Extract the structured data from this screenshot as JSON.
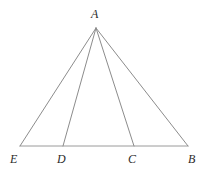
{
  "figure": {
    "kind": "euclidean-geometry-diagram",
    "canvas": {
      "width": 203,
      "height": 176,
      "background": "#ffffff"
    },
    "style": {
      "stroke_color": "#8c8c8c",
      "baseline_stroke_color": "#9a9a9a",
      "stroke_width": 1,
      "label_color": "#2b2b2b",
      "label_font_size_px": 12
    },
    "points": [
      {
        "id": "A",
        "label": "A",
        "x": 96,
        "y": 28,
        "label_x": 91,
        "label_y": 8,
        "role": "apex"
      },
      {
        "id": "E",
        "label": "E",
        "x": 20,
        "y": 146,
        "label_x": 10,
        "label_y": 153,
        "role": "base-left-end"
      },
      {
        "id": "D",
        "label": "D",
        "x": 63,
        "y": 146,
        "label_x": 57,
        "label_y": 153,
        "role": "base-interior"
      },
      {
        "id": "C",
        "label": "C",
        "x": 134,
        "y": 146,
        "label_x": 128,
        "label_y": 153,
        "role": "base-interior"
      },
      {
        "id": "B",
        "label": "B",
        "x": 188,
        "y": 146,
        "label_x": 188,
        "label_y": 153,
        "role": "base-right-end"
      }
    ],
    "segments": [
      {
        "id": "EB",
        "from": "E",
        "to": "B",
        "name": "base-line-EB",
        "kind": "baseline"
      },
      {
        "id": "AE",
        "from": "A",
        "to": "E",
        "name": "segment-AE",
        "kind": "side"
      },
      {
        "id": "AD",
        "from": "A",
        "to": "D",
        "name": "segment-AD",
        "kind": "cevian"
      },
      {
        "id": "AC",
        "from": "A",
        "to": "C",
        "name": "segment-AC",
        "kind": "cevian"
      },
      {
        "id": "AB",
        "from": "A",
        "to": "B",
        "name": "segment-AB",
        "kind": "side"
      }
    ]
  }
}
